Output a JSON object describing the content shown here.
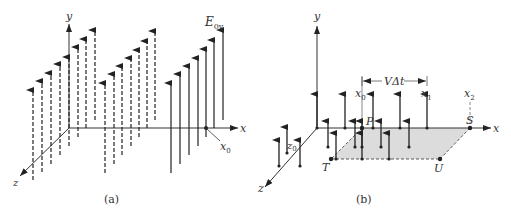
{
  "panel_a": {
    "caption": "(a)",
    "axis_labels": {
      "x": "x",
      "y": "y",
      "z": "z"
    },
    "field_label": "E",
    "field_subscript": "0y",
    "point_label": "x",
    "point_subscript": "0",
    "groups": [
      {
        "style": "dashed",
        "arrows": [
          {
            "x": 33,
            "top": 90,
            "bottom": 180
          },
          {
            "x": 42,
            "top": 81,
            "bottom": 172
          },
          {
            "x": 51,
            "top": 73,
            "bottom": 164
          },
          {
            "x": 60,
            "top": 64,
            "bottom": 155
          },
          {
            "x": 69,
            "top": 57,
            "bottom": 146
          },
          {
            "x": 78,
            "top": 47,
            "bottom": 137
          },
          {
            "x": 86,
            "top": 39,
            "bottom": 128
          },
          {
            "x": 95,
            "top": 30,
            "bottom": 120
          }
        ]
      },
      {
        "style": "dashed",
        "arrows": [
          {
            "x": 105,
            "top": 83,
            "bottom": 173
          },
          {
            "x": 114,
            "top": 74,
            "bottom": 164
          },
          {
            "x": 122,
            "top": 66,
            "bottom": 155
          },
          {
            "x": 131,
            "top": 58,
            "bottom": 146
          },
          {
            "x": 139,
            "top": 50,
            "bottom": 137
          },
          {
            "x": 147,
            "top": 41,
            "bottom": 128
          },
          {
            "x": 155,
            "top": 31,
            "bottom": 120
          }
        ]
      },
      {
        "style": "solid",
        "arrows": [
          {
            "x": 171,
            "top": 83,
            "bottom": 173
          },
          {
            "x": 180,
            "top": 74,
            "bottom": 164
          },
          {
            "x": 189,
            "top": 66,
            "bottom": 155
          },
          {
            "x": 198,
            "top": 58,
            "bottom": 146
          },
          {
            "x": 206,
            "top": 49,
            "bottom": 137
          },
          {
            "x": 214,
            "top": 40,
            "bottom": 128
          },
          {
            "x": 223,
            "top": 30,
            "bottom": 120
          }
        ]
      }
    ]
  },
  "panel_b": {
    "caption": "(b)",
    "axis_labels": {
      "x": "x",
      "y": "y",
      "z": "z"
    },
    "z0_label": "z",
    "z0_subscript": "0",
    "distance_label": "VΔt",
    "x_marks": [
      {
        "label": "x",
        "sub": "0"
      },
      {
        "label": "x",
        "sub": "1"
      },
      {
        "label": "x",
        "sub": "2"
      }
    ],
    "corner_labels": {
      "P": "P",
      "S": "S",
      "T": "T",
      "U": "U"
    },
    "shaded_region_color": "#dcdcdc"
  }
}
